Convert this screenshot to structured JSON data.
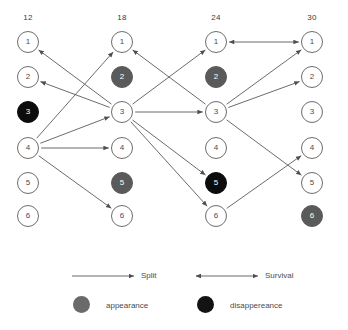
{
  "diagram": {
    "type": "lineage-tracking-graph",
    "columns": [
      {
        "label": "12",
        "x": 28,
        "nodes": [
          {
            "id": "1",
            "state": "white"
          },
          {
            "id": "2",
            "state": "white"
          },
          {
            "id": "3",
            "state": "black"
          },
          {
            "id": "4",
            "state": "white"
          },
          {
            "id": "5",
            "state": "white"
          },
          {
            "id": "6",
            "state": "white"
          }
        ]
      },
      {
        "label": "18",
        "x": 122,
        "nodes": [
          {
            "id": "1",
            "state": "white"
          },
          {
            "id": "2",
            "state": "gray"
          },
          {
            "id": "3",
            "state": "white"
          },
          {
            "id": "4",
            "state": "white"
          },
          {
            "id": "5",
            "state": "gray"
          },
          {
            "id": "6",
            "state": "white"
          }
        ]
      },
      {
        "label": "24",
        "x": 216,
        "nodes": [
          {
            "id": "1",
            "state": "white"
          },
          {
            "id": "2",
            "state": "gray"
          },
          {
            "id": "3",
            "state": "white"
          },
          {
            "id": "4",
            "state": "white"
          },
          {
            "id": "5",
            "state": "black"
          },
          {
            "id": "6",
            "state": "white"
          }
        ]
      },
      {
        "label": "30",
        "x": 312,
        "nodes": [
          {
            "id": "1",
            "state": "white"
          },
          {
            "id": "2",
            "state": "white"
          },
          {
            "id": "3",
            "state": "white"
          },
          {
            "id": "4",
            "state": "white"
          },
          {
            "id": "5",
            "state": "white"
          },
          {
            "id": "6",
            "state": "gray"
          }
        ]
      }
    ],
    "row_y": [
      42,
      77,
      112,
      148,
      183,
      216
    ],
    "edges": [
      {
        "from": "18.3",
        "to": "12.1",
        "kind": "split"
      },
      {
        "from": "18.3",
        "to": "12.2",
        "kind": "split"
      },
      {
        "from": "12.4",
        "to": "18.1",
        "kind": "split"
      },
      {
        "from": "12.4",
        "to": "18.3",
        "kind": "split"
      },
      {
        "from": "12.4",
        "to": "18.4",
        "kind": "split"
      },
      {
        "from": "12.4",
        "to": "18.6",
        "kind": "split"
      },
      {
        "from": "24.3",
        "to": "18.1",
        "kind": "split"
      },
      {
        "from": "18.3",
        "to": "24.1",
        "kind": "split"
      },
      {
        "from": "18.3",
        "to": "24.3",
        "kind": "split"
      },
      {
        "from": "18.3",
        "to": "24.5",
        "kind": "split"
      },
      {
        "from": "18.3",
        "to": "24.6",
        "kind": "split"
      },
      {
        "from": "24.1",
        "to": "30.1",
        "kind": "survival"
      },
      {
        "from": "24.3",
        "to": "30.1",
        "kind": "split"
      },
      {
        "from": "24.3",
        "to": "30.2",
        "kind": "split"
      },
      {
        "from": "24.3",
        "to": "30.5",
        "kind": "split"
      },
      {
        "from": "24.6",
        "to": "30.4",
        "kind": "split"
      }
    ]
  },
  "legend": {
    "split_label": "Split",
    "survival_label": "Survival",
    "appearance_label": "appearance",
    "disappearance_label": "disappereance",
    "colors": {
      "appearance": "#6a6a6a",
      "disappearance": "#131313",
      "stroke": "#545454",
      "node_stroke": "#6d6d6d"
    }
  }
}
